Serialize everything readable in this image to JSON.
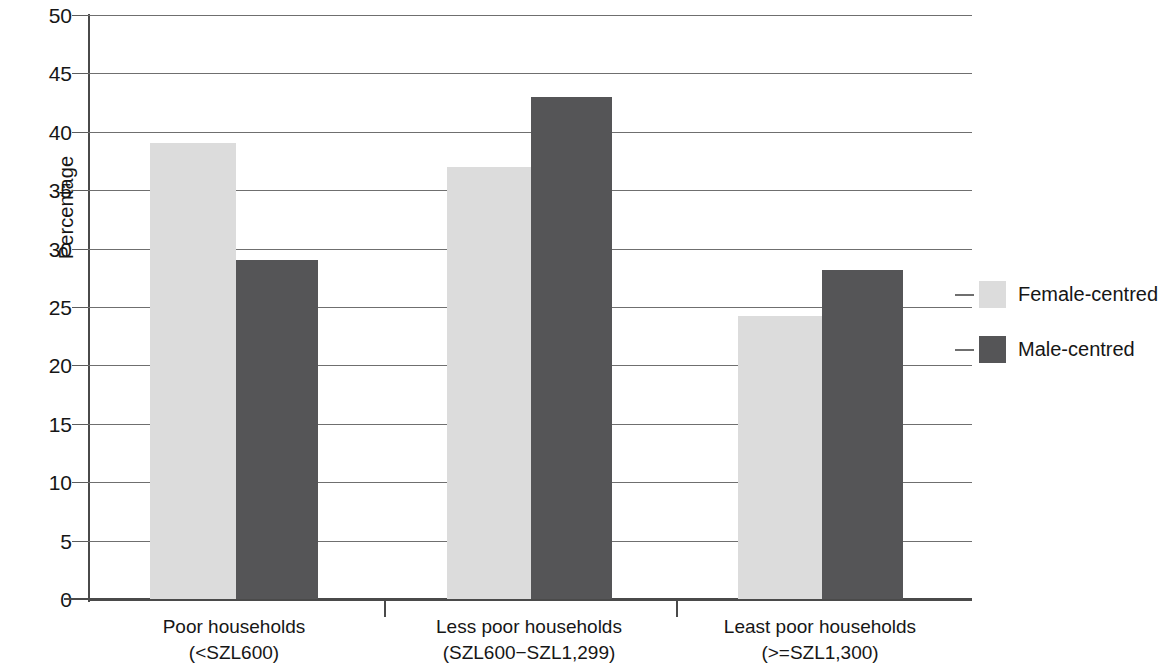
{
  "chart_data": {
    "type": "bar",
    "title": "",
    "subtitle": "",
    "xlabel": "",
    "ylabel": "Percentage",
    "ylim": [
      0,
      50
    ],
    "ytick_step": 5,
    "yticks": [
      50,
      45,
      40,
      35,
      30,
      25,
      20,
      15,
      10,
      5,
      0
    ],
    "ytick_labels": [
      "50",
      "45",
      "40",
      "35",
      "30",
      "25",
      "20",
      "15",
      "10",
      "5",
      "0"
    ],
    "grid": "horizontal",
    "legend_position": "right",
    "categories": [
      "Poor households\n(<SZL600)",
      "Less poor households\n(SZL600−SZL1,299)",
      "Least poor households\n(>=SZL1,300)"
    ],
    "category_lines": [
      {
        "line1": "Poor households",
        "line2": "(<SZL600)"
      },
      {
        "line1": "Less poor households",
        "line2": "(SZL600−SZL1,299)"
      },
      {
        "line1": "Least poor households",
        "line2": "(>=SZL1,300)"
      }
    ],
    "series": [
      {
        "name": "Female-centred",
        "color": "#dcdcdc",
        "values": [
          39,
          37,
          24.2
        ]
      },
      {
        "name": "Male-centred",
        "color": "#555557",
        "values": [
          29,
          43,
          28.2
        ]
      }
    ]
  },
  "legend": {
    "items": [
      {
        "label": "Female-centred",
        "swatch_class": "female"
      },
      {
        "label": "Male-centred",
        "swatch_class": "male"
      }
    ]
  },
  "axis": {
    "y_title": "Percentage"
  }
}
